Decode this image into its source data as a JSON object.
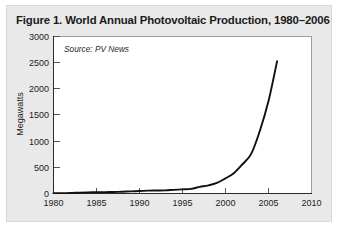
{
  "figure": {
    "title": "Figure 1. World Annual Photovoltaic Production, 1980–2006",
    "source_note": "Source: PV News",
    "card_background": "#e9e9e9",
    "plot_background": "#ffffff",
    "line_color": "#111111"
  },
  "chart_data": {
    "type": "line",
    "title": "Figure 1. World Annual Photovoltaic Production, 1980–2006",
    "subtitle": "",
    "xlabel": "",
    "ylabel": "Megawatts",
    "annotation": "Source: PV News",
    "grid": false,
    "legend": false,
    "legend_position": "none",
    "xlim": [
      1980,
      2010
    ],
    "ylim": [
      0,
      3000
    ],
    "xticks": [
      1980,
      1985,
      1990,
      1995,
      2000,
      2005,
      2010
    ],
    "xtick_labels": [
      "1980",
      "1985",
      "1990",
      "1995",
      "2000",
      "2005",
      "2010"
    ],
    "yticks": [
      0,
      500,
      1000,
      1500,
      2000,
      2500,
      3000
    ],
    "ytick_labels": [
      "0",
      "500",
      "1000",
      "1500",
      "2000",
      "2500",
      "3000"
    ],
    "series": [
      {
        "name": "World Annual Photovoltaic Production",
        "x": [
          1980,
          1981,
          1982,
          1983,
          1984,
          1985,
          1986,
          1987,
          1988,
          1989,
          1990,
          1991,
          1992,
          1993,
          1994,
          1995,
          1996,
          1997,
          1998,
          1999,
          2000,
          2001,
          2002,
          2003,
          2004,
          2005,
          2006
        ],
        "values": [
          7,
          8,
          9,
          17,
          22,
          23,
          26,
          29,
          34,
          40,
          47,
          55,
          58,
          60,
          69,
          78,
          89,
          126,
          155,
          201,
          288,
          391,
          562,
          760,
          1195,
          1760,
          2521
        ]
      }
    ]
  }
}
